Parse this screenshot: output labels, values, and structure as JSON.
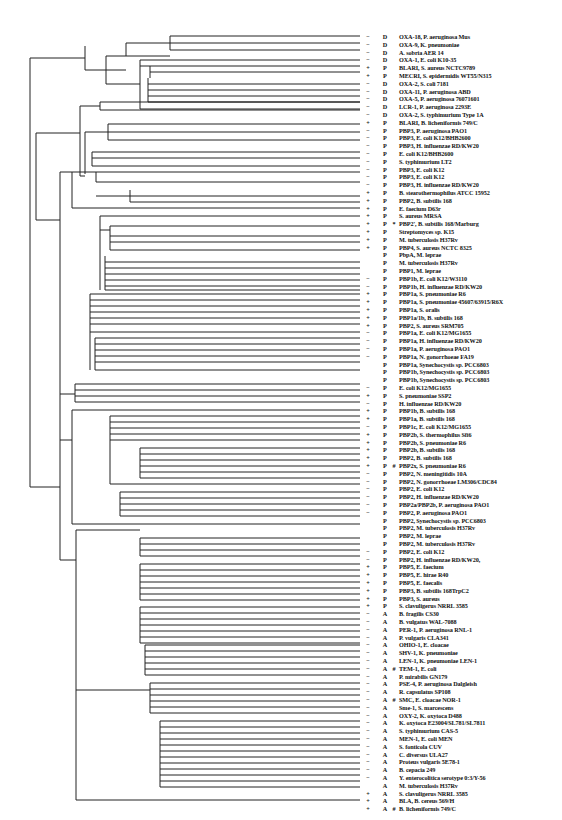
{
  "figure": {
    "type": "phylogenetic-tree",
    "line_color": "#222222",
    "background": "#ffffff",
    "columns": [
      "sign",
      "class",
      "mark",
      "name"
    ]
  },
  "leaves": [
    {
      "y": 36,
      "sign": "−",
      "cls": "D",
      "mark": "",
      "name": "OXA-18, P. aeruginosa Mus"
    },
    {
      "y": 43,
      "sign": "−",
      "cls": "D",
      "mark": "",
      "name": "OXA-9, K. pneumoniae"
    },
    {
      "y": 50,
      "sign": "−",
      "cls": "D",
      "mark": "",
      "name": "A. sobria AER 14"
    },
    {
      "y": 60,
      "sign": "−",
      "cls": "D",
      "mark": "",
      "name": "OXA-1, E. coli K10-35"
    },
    {
      "y": 66,
      "sign": "+",
      "cls": "P",
      "mark": "",
      "name": "BLARI, S. aureus NCTC9789"
    },
    {
      "y": 72,
      "sign": "+",
      "cls": "P",
      "mark": "",
      "name": "MECRI, S. epidermidis WT55/N315"
    },
    {
      "y": 78,
      "sign": "−",
      "cls": "D",
      "mark": "",
      "name": "OXA-2, S. coli 7181"
    },
    {
      "y": 84,
      "sign": "−",
      "cls": "D",
      "mark": "",
      "name": "OXA-11, P. aeruginosa ABD"
    },
    {
      "y": 90,
      "sign": "−",
      "cls": "D",
      "mark": "",
      "name": "OXA-5, P. aeruginosa 76071601"
    },
    {
      "y": 96,
      "sign": "−",
      "cls": "D",
      "mark": "",
      "name": "LCR-1, P. aeruginosa 2293E"
    },
    {
      "y": 102,
      "sign": "−",
      "cls": "D",
      "mark": "",
      "name": "OXA-2, S. typhimurium Type 1A"
    },
    {
      "y": 109,
      "sign": "+",
      "cls": "P",
      "mark": "",
      "name": "BLARI, B. licheniformis 749/C"
    },
    {
      "y": 120,
      "sign": "−",
      "cls": "P",
      "mark": "",
      "name": "PBP3, P. aeruginosa PAO1"
    },
    {
      "y": 126,
      "sign": "−",
      "cls": "P",
      "mark": "",
      "name": "PBP3, E. coli K12/BHB2600"
    },
    {
      "y": 132,
      "sign": "−",
      "cls": "P",
      "mark": "",
      "name": "PBP3, H. influenzae RD/KW20"
    },
    {
      "y": 140,
      "sign": "−",
      "cls": "P",
      "mark": "",
      "name": "E. coli K12/BHB2600"
    },
    {
      "y": 146,
      "sign": "−",
      "cls": "P",
      "mark": "",
      "name": "S. typhimurium LT2"
    },
    {
      "y": 152,
      "sign": "−",
      "cls": "P",
      "mark": "",
      "name": "PBP3, E. coli K12"
    },
    {
      "y": 158,
      "sign": "−",
      "cls": "P",
      "mark": "",
      "name": "PBP3, E. coli K12"
    },
    {
      "y": 164,
      "sign": "−",
      "cls": "P",
      "mark": "",
      "name": "PBP3, H. influenzae RD/KW20"
    },
    {
      "y": 172,
      "sign": "+",
      "cls": "P",
      "mark": "",
      "name": "B. stearothermophilus ATCC 15952"
    },
    {
      "y": 178,
      "sign": "+",
      "cls": "P",
      "mark": "",
      "name": "PBP2, B. subtilis 168"
    },
    {
      "y": 184,
      "sign": "+",
      "cls": "P",
      "mark": "",
      "name": "E. faecium D63r"
    },
    {
      "y": 190,
      "sign": "+",
      "cls": "P",
      "mark": "",
      "name": "S. aureus MRSA"
    },
    {
      "y": 196,
      "sign": "+",
      "cls": "P",
      "mark": "*",
      "name": "PBP2', B. subtilis 168/Marburg"
    },
    {
      "y": 202,
      "sign": "+",
      "cls": "P",
      "mark": "",
      "name": "Streptomyces sp. K15"
    },
    {
      "y": 208,
      "sign": "+",
      "cls": "P",
      "mark": "",
      "name": "M. tuberculosis H37Rv"
    },
    {
      "y": 216,
      "sign": "+",
      "cls": "P",
      "mark": "",
      "name": "PBP4, S. aureus NCTC 8325"
    },
    {
      "y": 230,
      "sign": "",
      "cls": "P",
      "mark": "",
      "name": "PbpA, M. leprae"
    },
    {
      "y": 236,
      "sign": "",
      "cls": "P",
      "mark": "",
      "name": "M. tuberculosis H37Rv"
    },
    {
      "y": 242,
      "sign": "",
      "cls": "P",
      "mark": "",
      "name": "PBP1, M. leprae"
    },
    {
      "y": 248,
      "sign": "−",
      "cls": "P",
      "mark": "",
      "name": "PBP1b, E. coli K12/W3110"
    },
    {
      "y": 256,
      "sign": "−",
      "cls": "P",
      "mark": "",
      "name": "PBP1b, H. influenzae RD/KW20"
    },
    {
      "y": 262,
      "sign": "+",
      "cls": "P",
      "mark": "",
      "name": "PBP1a, S. pneumoniae R6"
    },
    {
      "y": 268,
      "sign": "+",
      "cls": "P",
      "mark": "",
      "name": "PBP1a, S. pneumoniae 45607/63915/R6X"
    },
    {
      "y": 274,
      "sign": "+",
      "cls": "P",
      "mark": "",
      "name": "PBP1a, S. oralis"
    },
    {
      "y": 280,
      "sign": "+",
      "cls": "P",
      "mark": "",
      "name": "PBP1a/1b, B. subtilis 168"
    },
    {
      "y": 286,
      "sign": "+",
      "cls": "P",
      "mark": "",
      "name": "PBP2, S. aureus SRM705"
    },
    {
      "y": 294,
      "sign": "−",
      "cls": "P",
      "mark": "",
      "name": "PBP1a, E. coli K12/MG1655"
    },
    {
      "y": 300,
      "sign": "−",
      "cls": "P",
      "mark": "",
      "name": "PBP1a, H. influenzae RD/KW20"
    },
    {
      "y": 306,
      "sign": "−",
      "cls": "P",
      "mark": "",
      "name": "PBP1a, P. aeruginosa PAO1"
    },
    {
      "y": 312,
      "sign": "−",
      "cls": "P",
      "mark": "",
      "name": "PBP1a, N. gonorrhoeae FA19"
    },
    {
      "y": 318,
      "sign": "",
      "cls": "P",
      "mark": "",
      "name": "PBP1a, Synechocystis sp. PCC6803"
    },
    {
      "y": 324,
      "sign": "",
      "cls": "P",
      "mark": "",
      "name": "PBP1b, Synechocystis sp. PCC6803"
    },
    {
      "y": 332,
      "sign": "",
      "cls": "P",
      "mark": "",
      "name": "PBP1b, Synechocystis sp. PCC6803"
    },
    {
      "y": 338,
      "sign": "−",
      "cls": "P",
      "mark": "",
      "name": "E. coli K12/MG1655"
    },
    {
      "y": 344,
      "sign": "+",
      "cls": "P",
      "mark": "",
      "name": "S. pneumoniae SSP2"
    },
    {
      "y": 350,
      "sign": "−",
      "cls": "P",
      "mark": "",
      "name": "H. influenzae RD/KW20"
    },
    {
      "y": 356,
      "sign": "+",
      "cls": "P",
      "mark": "",
      "name": "PBP1b, B. subtilis 168"
    },
    {
      "y": 362,
      "sign": "+",
      "cls": "P",
      "mark": "",
      "name": "PBP1a, B. subtilis 168"
    },
    {
      "y": 368,
      "sign": "−",
      "cls": "P",
      "mark": "",
      "name": "PBP1c, E. coli K12/MG1655"
    },
    {
      "y": 384,
      "sign": "+",
      "cls": "P",
      "mark": "",
      "name": "PBP2b, S. thermophilus Sfi6"
    },
    {
      "y": 390,
      "sign": "+",
      "cls": "P",
      "mark": "",
      "name": "PBP2b, S. pneumoniae R6"
    },
    {
      "y": 396,
      "sign": "+",
      "cls": "P",
      "mark": "",
      "name": "PBP2b, B. subtilis 168"
    },
    {
      "y": 402,
      "sign": "+",
      "cls": "P",
      "mark": "",
      "name": "PBP2, B. subtilis 168"
    },
    {
      "y": 410,
      "sign": "+",
      "cls": "P",
      "mark": "#",
      "name": "PBP2x, S. pneumoniae R6"
    },
    {
      "y": 416,
      "sign": "−",
      "cls": "P",
      "mark": "",
      "name": "PBP2, N. meningitidis 10A"
    },
    {
      "y": 422,
      "sign": "−",
      "cls": "P",
      "mark": "",
      "name": "PBP2, N. gonorrhoeae LM306/CDC84"
    },
    {
      "y": 428,
      "sign": "−",
      "cls": "P",
      "mark": "",
      "name": "PBP2, E. coli K12"
    },
    {
      "y": 434,
      "sign": "−",
      "cls": "P",
      "mark": "",
      "name": "PBP2, H. influenzae RD/KW20"
    },
    {
      "y": 440,
      "sign": "−",
      "cls": "P",
      "mark": "",
      "name": "PBP2a/PBP2b, P. aeruginosa PAO1"
    },
    {
      "y": 448,
      "sign": "−",
      "cls": "P",
      "mark": "",
      "name": "PBP2, P. aeruginosa PAO1"
    },
    {
      "y": 454,
      "sign": "",
      "cls": "P",
      "mark": "",
      "name": "PBP2, Synechocystis sp. PCC6803"
    },
    {
      "y": 460,
      "sign": "",
      "cls": "P",
      "mark": "",
      "name": "PBP2, M. tuberculosis H37Rv"
    },
    {
      "y": 466,
      "sign": "",
      "cls": "P",
      "mark": "",
      "name": "PBP2, M. leprae"
    },
    {
      "y": 472,
      "sign": "",
      "cls": "P",
      "mark": "",
      "name": "PBP2, M. tuberculosis H37Rv"
    },
    {
      "y": 478,
      "sign": "−",
      "cls": "P",
      "mark": "",
      "name": "PBP2, E. coli K12"
    },
    {
      "y": 484,
      "sign": "−",
      "cls": "P",
      "mark": "",
      "name": "PBP2, H. influenzae RD/KW20,"
    },
    {
      "y": 492,
      "sign": "+",
      "cls": "P",
      "mark": "",
      "name": "PBP5, E. faecium"
    },
    {
      "y": 498,
      "sign": "+",
      "cls": "P",
      "mark": "",
      "name": "PBP5, E. hirae R40"
    },
    {
      "y": 504,
      "sign": "+",
      "cls": "P",
      "mark": "",
      "name": "PBP5, E. faecalis"
    },
    {
      "y": 510,
      "sign": "+",
      "cls": "P",
      "mark": "",
      "name": "PBP3, B. subtilis 168TrpC2"
    },
    {
      "y": 516,
      "sign": "+",
      "cls": "P",
      "mark": "",
      "name": "PBP3, S. aureus"
    },
    {
      "y": 524,
      "sign": "+",
      "cls": "P",
      "mark": "",
      "name": "S. clavuligerus NRRL 3585"
    },
    {
      "y": 538,
      "sign": "−",
      "cls": "A",
      "mark": "",
      "name": "B. fragilis CS30"
    },
    {
      "y": 544,
      "sign": "−",
      "cls": "A",
      "mark": "",
      "name": "B. vulgatus WAL-7088"
    },
    {
      "y": 550,
      "sign": "−",
      "cls": "A",
      "mark": "",
      "name": "PER-1, P. aeruginosa RNL-1"
    },
    {
      "y": 556,
      "sign": "−",
      "cls": "A",
      "mark": "",
      "name": "P. vulgaris CLA341"
    },
    {
      "y": 564,
      "sign": "−",
      "cls": "A",
      "mark": "",
      "name": "OHIO-1, E. cloacae"
    },
    {
      "y": 570,
      "sign": "−",
      "cls": "A",
      "mark": "",
      "name": "SHV-1, K. pneumoniae"
    },
    {
      "y": 576,
      "sign": "−",
      "cls": "A",
      "mark": "",
      "name": "LEN-1, K. pneumoniae LEN-1"
    },
    {
      "y": 582,
      "sign": "−",
      "cls": "A",
      "mark": "#",
      "name": "TEM-1, E. coli"
    },
    {
      "y": 588,
      "sign": "−",
      "cls": "A",
      "mark": "",
      "name": "P. mirabilis GN179"
    },
    {
      "y": 594,
      "sign": "−",
      "cls": "A",
      "mark": "",
      "name": "PSE-4, P. aeruginosa Dalgleish"
    },
    {
      "y": 600,
      "sign": "−",
      "cls": "A",
      "mark": "",
      "name": "R. capsulatus SP108"
    },
    {
      "y": 607,
      "sign": "−",
      "cls": "A",
      "mark": "#",
      "name": "SMC, E. cloacae NOR-1"
    },
    {
      "y": 613,
      "sign": "−",
      "cls": "A",
      "mark": "",
      "name": "Sme-1, S. marcescens"
    },
    {
      "y": 619,
      "sign": "−",
      "cls": "A",
      "mark": "",
      "name": "OXY-2, K. oxytoca D488"
    },
    {
      "y": 625,
      "sign": "−",
      "cls": "A",
      "mark": "",
      "name": "K. oxytoca E23004/SL781/SL7811"
    },
    {
      "y": 631,
      "sign": "−",
      "cls": "A",
      "mark": "",
      "name": "S. typhimurium CAS-5"
    },
    {
      "y": 637,
      "sign": "−",
      "cls": "A",
      "mark": "",
      "name": "MEN-1, E. coli MEN"
    },
    {
      "y": 645,
      "sign": "−",
      "cls": "A",
      "mark": "",
      "name": "S. fonticola CUV"
    },
    {
      "y": 651,
      "sign": "−",
      "cls": "A",
      "mark": "",
      "name": "C. diversus ULA27"
    },
    {
      "y": 657,
      "sign": "−",
      "cls": "A",
      "mark": "",
      "name": "Proteus vulgaris 5E78-1"
    },
    {
      "y": 663,
      "sign": "−",
      "cls": "A",
      "mark": "",
      "name": "B. cepacia 249"
    },
    {
      "y": 669,
      "sign": "−",
      "cls": "A",
      "mark": "",
      "name": "Y. enterocolitica serotype 0:3/Y-56"
    },
    {
      "y": 675,
      "sign": "",
      "cls": "A",
      "mark": "",
      "name": "M. tuberculosis H37Rv"
    },
    {
      "y": 683,
      "sign": "+",
      "cls": "A",
      "mark": "",
      "name": "S. clavuligerus NRRL 3585"
    },
    {
      "y": 689,
      "sign": "+",
      "cls": "A",
      "mark": "",
      "name": "BLA, B. cereus 569/H"
    },
    {
      "y": 695,
      "sign": "+",
      "cls": "A",
      "mark": "#",
      "name": "B. licheniformis 749/C"
    },
    {
      "y": 701,
      "sign": "+",
      "cls": "A",
      "mark": "",
      "name": "I, B. mycoides NI10R"
    },
    {
      "y": 707,
      "sign": "+",
      "cls": "A",
      "mark": "*",
      "name": "I, B. cereus 569/H/9"
    },
    {
      "y": 713,
      "sign": "+",
      "cls": "A",
      "mark": "",
      "name": "I, B. cereus 5/B"
    },
    {
      "y": 721,
      "sign": "+",
      "cls": "A",
      "mark": "",
      "name": "B. subtilis 168/BGM"
    },
    {
      "y": 727,
      "sign": "+",
      "cls": "A",
      "mark": "",
      "name": "S. cacaoi DSM40057"
    },
    {
      "y": 733,
      "sign": "+",
      "cls": "A",
      "mark": "",
      "name": "S. badius DSM40139"
    },
    {
      "y": 739,
      "sign": "+",
      "cls": "A",
      "mark": "",
      "name": "Actinomadura sp. R39"
    },
    {
      "y": 745,
      "sign": "+",
      "cls": "A",
      "mark": "",
      "name": "S. lavendulae LC411"
    },
    {
      "y": 751,
      "sign": "+",
      "cls": "A",
      "mark": "",
      "name": "S. cacaoi KCC S0352"
    },
    {
      "y": 757,
      "sign": "−",
      "cls": "A",
      "mark": "",
      "name": "ROB-1, H. influenzae F990/LNPB51/A1"
    },
    {
      "y": 763,
      "sign": "+",
      "cls": "A",
      "mark": "",
      "name": "S. fradiae DSM40063"
    },
    {
      "y": 769,
      "sign": "+",
      "cls": "A",
      "mark": "",
      "name": "S. lavendulae DSM2014"
    },
    {
      "y": 775,
      "sign": "+",
      "cls": "A",
      "mark": "*",
      "name": "S. albus G"
    },
    {
      "y": 781,
      "sign": "+",
      "cls": "A",
      "mark": "",
      "name": "S. lavendulae KCCS0263"
    },
    {
      "y": 787,
      "sign": "+",
      "cls": "A",
      "mark": "",
      "name": "S. aureofaciens"
    }
  ],
  "leaves_tail": [
    {
      "y": 625,
      "sign": "+",
      "cls": "A",
      "mark": "",
      "name": "S. cellulosae KCCS0127"
    },
    {
      "y": 631,
      "sign": "",
      "cls": "A",
      "mark": "",
      "name": "M. fortuitum"
    },
    {
      "y": 637,
      "sign": "+",
      "cls": "A",
      "mark": "#",
      "name": "S. aureus PC1/SK456/NCTC9789"
    },
    {
      "y": 643,
      "sign": "−",
      "cls": "A",
      "mark": "",
      "name": "BRO-1, M. catarrhalis ATCC 53879"
    },
    {
      "y": 653,
      "sign": "−",
      "cls": "P",
      "mark": "*",
      "name": "PBP4, E. coli K12/MG1655"
    },
    {
      "y": 659,
      "sign": "−",
      "cls": "P",
      "mark": "",
      "name": "PBP4, H. influenzae RD/KW20"
    },
    {
      "y": 665,
      "sign": "+",
      "cls": "P",
      "mark": "",
      "name": "PBP4, Actinomadura sp. R39"
    },
    {
      "y": 671,
      "sign": "+",
      "cls": "P",
      "mark": "",
      "name": "B. subtilis 168"
    },
    {
      "y": 677,
      "sign": "",
      "cls": "P",
      "mark": "",
      "name": "PBP4, Synechocystis sp. PCC6803"
    },
    {
      "y": 683,
      "sign": "",
      "cls": "P",
      "mark": "",
      "name": "PBP4, M. tuberculosis H37Rv"
    },
    {
      "y": 696,
      "sign": "+",
      "cls": "P",
      "mark": "#",
      "name": "PBP-Zn-dependent, S. albus G"
    },
    {
      "y": 710,
      "sign": "−",
      "cls": "C",
      "mark": "*",
      "name": "C. freundii OS60/GN346"
    },
    {
      "y": 716,
      "sign": "−",
      "cls": "C",
      "mark": "",
      "name": "E. coli K12/MG1655"
    },
    {
      "y": 722,
      "sign": "−",
      "cls": "C",
      "mark": "#",
      "name": "P99, E. cloacae P99/Q908R/MHN1"
    },
    {
      "y": 728,
      "sign": "−",
      "cls": "C",
      "mark": "",
      "name": "Y. enterocolitica IP97/serotype 0:5B"
    },
    {
      "y": 734,
      "sign": "−",
      "cls": "C",
      "mark": "",
      "name": "M. morganii SLM01"
    },
    {
      "y": 742,
      "sign": "−",
      "cls": "C",
      "mark": "",
      "name": "A. sobria 163a"
    },
    {
      "y": 748,
      "sign": "−",
      "cls": "C",
      "mark": "",
      "name": "FOX-3, K. oxytoca 1731"
    },
    {
      "y": 754,
      "sign": "−",
      "cls": "C",
      "mark": "",
      "name": "K. pneumoniae NU2936"
    },
    {
      "y": 760,
      "sign": "−",
      "cls": "C",
      "mark": "",
      "name": "P. aeruginosa PAO1"
    },
    {
      "y": 766,
      "sign": "−",
      "cls": "C",
      "mark": "",
      "name": "S. marcescens SR50"
    },
    {
      "y": 772,
      "sign": "−",
      "cls": "C",
      "mark": "",
      "name": "P. immobilis A5"
    },
    {
      "y": 782,
      "sign": "",
      "cls": "P",
      "mark": "",
      "name": "M. tuberculosis H37Rv"
    },
    {
      "y": 788,
      "sign": "",
      "cls": "P",
      "mark": "",
      "name": "M. tuberculosis H37Rv"
    },
    {
      "y": 794,
      "sign": "+",
      "cls": "P",
      "mark": "#",
      "name": "Streptomyces sp. K61"
    },
    {
      "y": 800,
      "sign": "",
      "cls": "P",
      "mark": "",
      "name": "PBP4, M. tuberculosis H37Rv"
    },
    {
      "y": 806,
      "sign": "+",
      "cls": "P",
      "mark": "",
      "name": "PBP4, N. lactamdurans LC411"
    },
    {
      "y": 812,
      "sign": "",
      "cls": "P",
      "mark": "",
      "name": "PBP4, Synechocystis sp. PCC6803"
    }
  ]
}
